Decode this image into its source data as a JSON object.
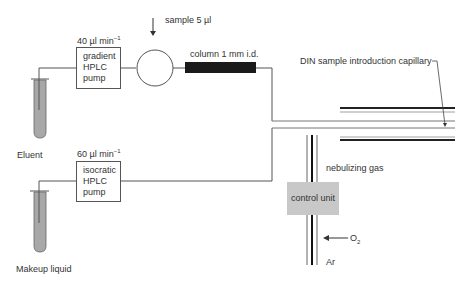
{
  "diagram": {
    "sample_label": "sample 5 µl",
    "column_label": "column 1 mm i.d.",
    "capillary_label": "DIN sample introduction capillary",
    "nebulizing_gas_label": "nebulizing gas",
    "control_unit_label": "control unit",
    "o2_label": "O",
    "o2_sub": "2",
    "ar_label": "Ar",
    "eluent_label": "Eluent",
    "makeup_label": "Makeup liquid",
    "gradient_pump": {
      "flow": "40 µl min",
      "flow_exp": "−1",
      "lines": [
        "gradient",
        "HPLC",
        "pump"
      ]
    },
    "isocratic_pump": {
      "flow": "60 µl min",
      "flow_exp": "−1",
      "lines": [
        "isocratic",
        "HPLC",
        "pump"
      ]
    },
    "colors": {
      "line": "#555555",
      "column_fill": "#1a1a1a",
      "liquid_fill": "#a8a8a8",
      "control_unit_fill": "#c8c8c8"
    }
  }
}
